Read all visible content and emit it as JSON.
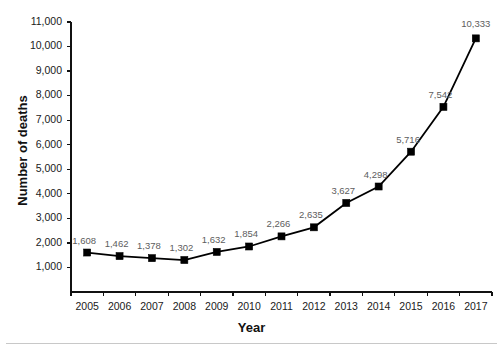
{
  "chart_data": {
    "type": "line",
    "title": "",
    "xlabel": "Year",
    "ylabel": "Number of deaths",
    "categories": [
      "2005",
      "2006",
      "2007",
      "2008",
      "2009",
      "2010",
      "2011",
      "2012",
      "2013",
      "2014",
      "2015",
      "2016",
      "2017"
    ],
    "values": [
      1608,
      1462,
      1378,
      1302,
      1632,
      1854,
      2266,
      2635,
      3627,
      4298,
      5716,
      7542,
      10333
    ],
    "point_labels": [
      "1,608",
      "1,462",
      "1,378",
      "1,302",
      "1,632",
      "1,854",
      "2,266",
      "2,635",
      "3,627",
      "4,298",
      "5,716",
      "7,542",
      "10,333"
    ],
    "ytick_values": [
      1000,
      2000,
      3000,
      4000,
      5000,
      6000,
      7000,
      8000,
      9000,
      10000,
      11000
    ],
    "ytick_labels": [
      "1,000",
      "2,000",
      "3,000",
      "4,000",
      "5,000",
      "6,000",
      "7,000",
      "8,000",
      "9,000",
      "10,000",
      "11,000"
    ],
    "ylim": [
      0,
      11000
    ],
    "grid": false,
    "legend": null,
    "marker": "square",
    "series_color": "#000000",
    "label_color": "#5d5d5d",
    "axis_color": "#111111"
  }
}
